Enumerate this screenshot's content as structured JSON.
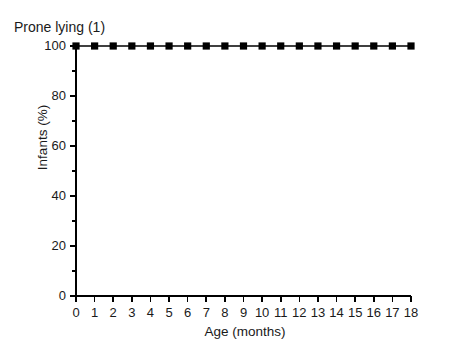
{
  "chart_data": {
    "type": "line",
    "title": "Prone lying (1)",
    "xlabel": "Age (months)",
    "ylabel": "Infants (%)",
    "x": [
      0,
      1,
      2,
      3,
      4,
      5,
      6,
      7,
      8,
      9,
      10,
      11,
      12,
      13,
      14,
      15,
      16,
      17,
      18
    ],
    "values": [
      100,
      100,
      100,
      100,
      100,
      100,
      100,
      100,
      100,
      100,
      100,
      100,
      100,
      100,
      100,
      100,
      100,
      100,
      100
    ],
    "series": [
      {
        "name": "Prone lying (1)",
        "values": [
          100,
          100,
          100,
          100,
          100,
          100,
          100,
          100,
          100,
          100,
          100,
          100,
          100,
          100,
          100,
          100,
          100,
          100,
          100
        ],
        "marker": "filled-square",
        "color": "#000000"
      }
    ],
    "xlim": [
      0,
      18
    ],
    "ylim": [
      0,
      100
    ],
    "xticks": [
      0,
      1,
      2,
      3,
      4,
      5,
      6,
      7,
      8,
      9,
      10,
      11,
      12,
      13,
      14,
      15,
      16,
      17,
      18
    ],
    "xtick_labels": [
      "0",
      "1",
      "2",
      "3",
      "4",
      "5",
      "6",
      "7",
      "8",
      "9",
      "10",
      "11",
      "12",
      "13",
      "14",
      "15",
      "16",
      "17",
      "18"
    ],
    "yticks": [
      0,
      20,
      40,
      60,
      80,
      100
    ],
    "ytick_labels": [
      "0",
      "20",
      "40",
      "60",
      "80",
      "100"
    ],
    "yticks_minor": [
      10,
      30,
      50,
      70,
      90
    ],
    "grid": false,
    "legend": "none",
    "background": "#ffffff",
    "axis_color": "#000000",
    "spines": [
      "left",
      "bottom"
    ]
  }
}
